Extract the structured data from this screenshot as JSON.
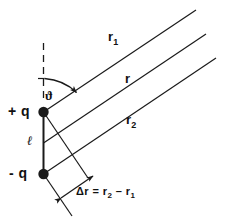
{
  "figure": {
    "kind": "physics-diagram",
    "background_color": "#ffffff",
    "ink_color": "#1a1a1a"
  },
  "rays": [
    {
      "name": "r1",
      "label": "r",
      "subscript": "1"
    },
    {
      "name": "r",
      "label": "r",
      "subscript": ""
    },
    {
      "name": "r2",
      "label": "r",
      "subscript": "2"
    }
  ],
  "charges": [
    {
      "name": "positive-charge",
      "label": "+ q",
      "sign": "+"
    },
    {
      "name": "negative-charge",
      "label": "- q",
      "sign": "-"
    }
  ],
  "separation": {
    "label": "ℓ",
    "name": "dipole-separation"
  },
  "angle": {
    "label": "ϑ",
    "name": "theta-angle"
  },
  "path_difference": {
    "lhs": "Δr",
    "equals": "=",
    "term1": "r",
    "term1_sub": "2",
    "minus": "–",
    "term2": "r",
    "term2_sub": "1",
    "full": "Δr = r2 – r1"
  }
}
